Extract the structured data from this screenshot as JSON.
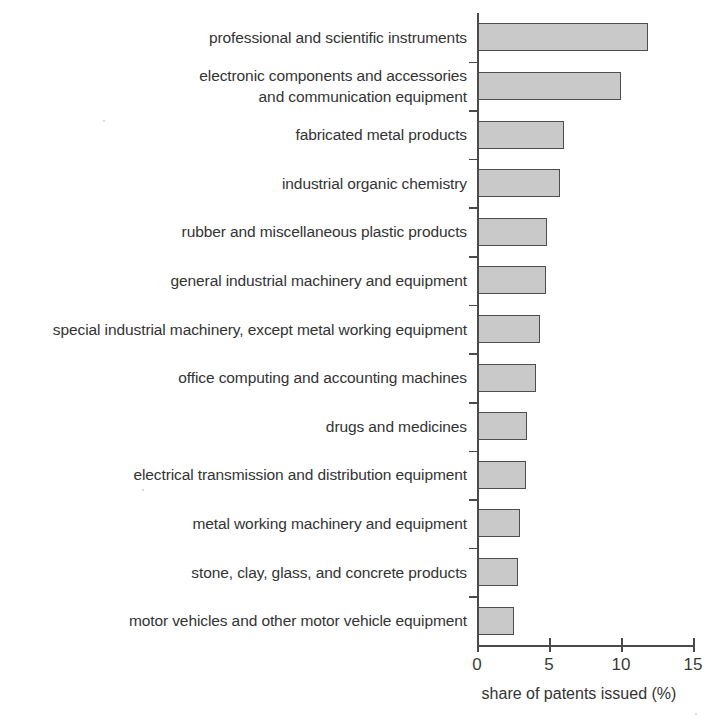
{
  "chart_data": {
    "type": "bar",
    "orientation": "horizontal",
    "title": "",
    "subtitle": "",
    "xlabel": "share of patents issued (%)",
    "ylabel": "",
    "xlim": [
      0,
      15
    ],
    "xticks": [
      0,
      5,
      10,
      15
    ],
    "xtick_labels": [
      "0",
      "5",
      "10",
      "15"
    ],
    "grid": false,
    "legend": null,
    "bar_fill_color": "#c9c9c9",
    "bar_edge_color": "#4e4e4e",
    "axis_color": "#4a4a4a",
    "text_color": "#333333",
    "categories": [
      "professional and scientific instruments",
      "electronic components and accessories\nand communication equipment",
      "fabricated metal products",
      "industrial organic chemistry",
      "rubber and miscellaneous plastic products",
      "general industrial machinery and equipment",
      "special industrial machinery, except metal working equipment",
      "office computing and accounting machines",
      "drugs and medicines",
      "electrical transmission and distribution equipment",
      "metal working machinery and equipment",
      "stone, clay, glass, and concrete products",
      "motor vehicles and other motor vehicle equipment"
    ],
    "values": [
      11.8,
      9.9,
      6.0,
      5.7,
      4.8,
      4.7,
      4.3,
      4.0,
      3.4,
      3.3,
      2.9,
      2.8,
      2.5
    ],
    "value_unit": "%"
  },
  "axis": {
    "x_title": "share of patents issued (%)",
    "tick_labels": [
      "0",
      "5",
      "10",
      "15"
    ]
  }
}
